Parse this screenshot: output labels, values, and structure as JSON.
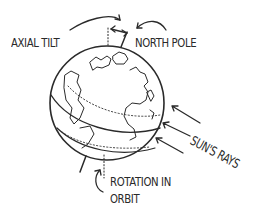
{
  "diagram": {
    "labels": {
      "axial_tilt": "AXIAL TILT",
      "north_pole": "NORTH POLE",
      "suns_rays": "SUN'S RAYS",
      "rotation_line1": "ROTATION IN",
      "rotation_line2": "ORBIT"
    },
    "elements": {
      "globe": "Earth globe with continents (Europe, Africa, Americas)",
      "axis": "tilted rotational axis",
      "vertical_reference": "dotted vertical line",
      "rays_count": 3
    },
    "colors": {
      "ink": "#2a2a2a",
      "background": "#ffffff"
    }
  }
}
